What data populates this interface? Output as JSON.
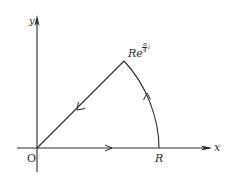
{
  "diagram": {
    "title": "",
    "colors": {
      "stroke": "#2a2a2a",
      "background": "#ffffff"
    },
    "axes": {
      "x_label": "x",
      "y_label": "y",
      "origin_label": "O"
    },
    "points": {
      "R_label": "R",
      "apex_label_base": "Re",
      "apex_label_exponent": "π/4 i",
      "apex_label_exp_num": "π",
      "apex_label_exp_den": "4",
      "apex_label_exp_i": "i"
    },
    "contour": {
      "segments": [
        {
          "name": "real-axis-segment",
          "from": "O",
          "to": "R",
          "direction": "right"
        },
        {
          "name": "arc-segment",
          "from": "R",
          "to": "Re^{πi/4}",
          "direction": "counterclockwise"
        },
        {
          "name": "ray-segment",
          "from": "Re^{πi/4}",
          "to": "O",
          "direction": "toward-origin"
        }
      ],
      "angle": "π/4"
    }
  }
}
